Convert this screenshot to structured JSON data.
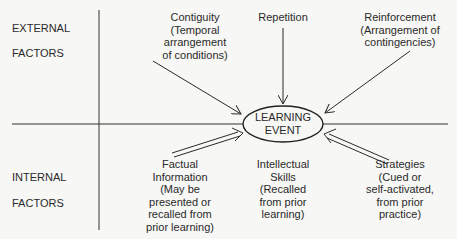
{
  "diagram": {
    "external_label_1": "EXTERNAL",
    "external_label_2": "FACTORS",
    "internal_label_1": "INTERNAL",
    "internal_label_2": "FACTORS",
    "center": {
      "line1": "LEARNING",
      "line2": "EVENT"
    },
    "external_factors": [
      {
        "text": "Contiguity\n(Temporal\narrangement\nof conditions)"
      },
      {
        "text": "Repetition"
      },
      {
        "text": "Reinforcement\n(Arrangement of\ncontingencies)"
      }
    ],
    "internal_factors": [
      {
        "text": "Factual\nInformation\n(May be\npresented or\nrecalled from\nprior learning)"
      },
      {
        "text": "Intellectual\nSkills\n(Recalled\nfrom prior\nlearning)"
      },
      {
        "text": "Strategies\n(Cued or\nself-activated,\nfrom prior\npractice)"
      }
    ]
  }
}
